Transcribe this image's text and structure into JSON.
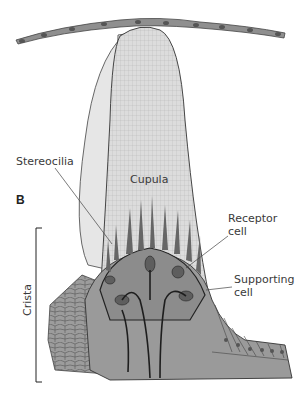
{
  "figure": {
    "panel_label": "B",
    "labels": {
      "cupula": "Cupula",
      "stereocilia": "Stereocilia",
      "receptor_cell_line1": "Receptor",
      "receptor_cell_line2": "cell",
      "supporting_cell_line1": "Supporting",
      "supporting_cell_line2": "cell",
      "crista": "Crista"
    },
    "colors": {
      "membrane": "#8f8f8f",
      "cupula_fill": "#d9d9d9",
      "cupula_side": "#e3e3e3",
      "tissue": "#9a9a9a",
      "receptor": "#6e6e6e",
      "outline": "#2a2a2a"
    }
  }
}
